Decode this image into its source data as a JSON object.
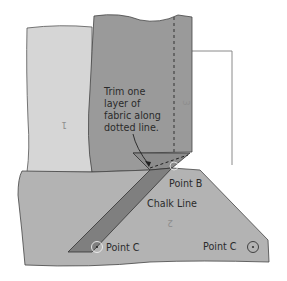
{
  "diagram": {
    "colors": {
      "background": "#ffffff",
      "fabric_1": "#d6d6d6",
      "fabric_2": "#b3b3b3",
      "fabric_3": "#9a9a9a",
      "strip": "#7f7f7f",
      "outline": "#3a3a3a",
      "text": "#2b2b2b",
      "piece_number": "#8e8e8e"
    },
    "annotation": {
      "lines": [
        "Trim one",
        "layer of",
        "fabric along",
        "dotted line."
      ]
    },
    "labels": {
      "point_b": "Point B",
      "chalk_line": "Chalk Line",
      "point_c_left": "Point C",
      "point_c_right": "Point C"
    },
    "piece_numbers": {
      "piece_1": "1",
      "piece_2": "2",
      "piece_3": "3"
    },
    "icons": {
      "point_c_left_marker": "circle-dot-icon",
      "point_c_right_marker": "circle-dot-icon",
      "arrow": "arrow-icon"
    }
  }
}
